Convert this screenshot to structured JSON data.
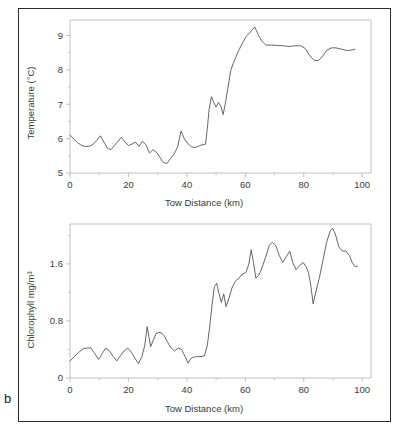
{
  "figure": {
    "panel_label": "b"
  },
  "chart_data": [
    {
      "type": "line",
      "id": "temperature",
      "title": "",
      "xlabel": "Tow Distance (km)",
      "ylabel": "Temperature (°C)",
      "xlim": [
        0,
        103
      ],
      "ylim": [
        5,
        9.45
      ],
      "grid": false,
      "legend": null,
      "xticks": [
        0,
        20,
        40,
        60,
        80,
        100
      ],
      "xtick_labels": [
        "0",
        "20",
        "40",
        "60",
        "80",
        "100"
      ],
      "xminor_ticks": [
        10,
        30,
        50,
        70,
        90
      ],
      "yticks": [
        5,
        6,
        7,
        8,
        9
      ],
      "ytick_labels": [
        "5",
        "6",
        "7",
        "8",
        "9"
      ],
      "yminor_ticks": [
        5.5,
        6.5,
        7.5,
        8.5
      ],
      "series": [
        {
          "name": "Temperature",
          "x": [
            0,
            1.2,
            2.6,
            4.0,
            5.4,
            6.8,
            8.0,
            9.2,
            10.4,
            11.6,
            12.8,
            14.0,
            15.2,
            16.4,
            17.6,
            18.8,
            20.0,
            21.2,
            22.4,
            23.6,
            24.8,
            26.0,
            27.2,
            28.4,
            29.6,
            30.8,
            32.0,
            33.2,
            34.4,
            35.6,
            36.8,
            38.0,
            39.2,
            40.4,
            41.6,
            42.8,
            44.0,
            45.2,
            46.4,
            47.0,
            47.6,
            48.4,
            49.2,
            50.0,
            50.8,
            51.6,
            52.4,
            53.2,
            54.0,
            55.0,
            56.0,
            57.5,
            59.0,
            60.5,
            62.0,
            63.2,
            64.5,
            65.8,
            67.0,
            69.0,
            71.0,
            73.0,
            75.0,
            77.0,
            79.0,
            80.5,
            82.0,
            83.5,
            85.0,
            86.5,
            88.0,
            89.5,
            91.0,
            93.0,
            95.0,
            96.5,
            97.5
          ],
          "y": [
            6.1,
            6.0,
            5.88,
            5.8,
            5.77,
            5.78,
            5.84,
            5.95,
            6.08,
            5.9,
            5.72,
            5.68,
            5.8,
            5.92,
            6.04,
            5.9,
            5.8,
            5.84,
            5.9,
            5.78,
            5.92,
            5.82,
            5.58,
            5.68,
            5.6,
            5.45,
            5.3,
            5.28,
            5.42,
            5.55,
            5.75,
            6.22,
            5.98,
            5.85,
            5.76,
            5.74,
            5.78,
            5.82,
            5.84,
            6.3,
            6.85,
            7.22,
            7.05,
            6.92,
            7.05,
            6.95,
            6.7,
            7.05,
            7.45,
            7.98,
            8.22,
            8.52,
            8.78,
            9.0,
            9.12,
            9.25,
            9.0,
            8.82,
            8.72,
            8.72,
            8.71,
            8.7,
            8.68,
            8.7,
            8.7,
            8.62,
            8.42,
            8.28,
            8.27,
            8.4,
            8.58,
            8.64,
            8.64,
            8.6,
            8.56,
            8.58,
            8.6
          ]
        }
      ]
    },
    {
      "type": "line",
      "id": "chlorophyll",
      "title": "",
      "xlabel": "Tow Distance (km)",
      "ylabel": "Chlorophyll mg/m³",
      "xlim": [
        0,
        103
      ],
      "ylim": [
        0,
        2.16
      ],
      "grid": false,
      "legend": null,
      "xticks": [
        0,
        20,
        40,
        60,
        80,
        100
      ],
      "xtick_labels": [
        "0",
        "20",
        "40",
        "60",
        "80",
        "100"
      ],
      "xminor_ticks": [
        10,
        30,
        50,
        70,
        90
      ],
      "yticks": [
        0,
        0.8,
        1.6
      ],
      "ytick_labels": [
        "0",
        "0.8",
        "1.6"
      ],
      "yminor_ticks": [
        0.4,
        1.2,
        2.0
      ],
      "series": [
        {
          "name": "Chlorophyll",
          "x": [
            0,
            1.5,
            3.0,
            4.5,
            6.0,
            7.2,
            8.5,
            9.8,
            11.0,
            12.2,
            13.5,
            14.8,
            16.0,
            17.2,
            18.5,
            19.8,
            21.0,
            22.2,
            23.4,
            24.6,
            25.6,
            26.4,
            27.0,
            27.6,
            28.4,
            29.4,
            30.4,
            31.4,
            32.4,
            33.4,
            34.6,
            35.8,
            37.0,
            38.2,
            39.4,
            40.4,
            41.5,
            43.0,
            44.5,
            46.0,
            47.0,
            47.8,
            48.6,
            49.4,
            50.2,
            51.0,
            51.8,
            52.6,
            53.4,
            54.4,
            55.4,
            56.6,
            57.8,
            59.0,
            60.2,
            61.2,
            62.0,
            62.8,
            63.6,
            64.6,
            65.8,
            67.0,
            68.2,
            69.2,
            70.4,
            71.6,
            72.8,
            74.0,
            75.2,
            76.2,
            77.4,
            78.6,
            79.8,
            80.8,
            81.6,
            82.4,
            83.2,
            84.2,
            85.4,
            86.6,
            87.8,
            89.0,
            89.8,
            90.8,
            92.0,
            93.2,
            94.4,
            95.6,
            96.6,
            97.6,
            98.4
          ],
          "y": [
            0.24,
            0.3,
            0.36,
            0.41,
            0.42,
            0.42,
            0.34,
            0.26,
            0.34,
            0.42,
            0.38,
            0.3,
            0.24,
            0.31,
            0.38,
            0.42,
            0.36,
            0.28,
            0.2,
            0.3,
            0.46,
            0.72,
            0.58,
            0.44,
            0.52,
            0.62,
            0.64,
            0.63,
            0.58,
            0.5,
            0.42,
            0.38,
            0.42,
            0.4,
            0.3,
            0.21,
            0.28,
            0.3,
            0.3,
            0.31,
            0.46,
            0.72,
            1.02,
            1.28,
            1.33,
            1.18,
            1.06,
            1.18,
            1.0,
            1.12,
            1.26,
            1.36,
            1.4,
            1.46,
            1.48,
            1.6,
            1.8,
            1.62,
            1.4,
            1.44,
            1.56,
            1.7,
            1.86,
            1.9,
            1.86,
            1.72,
            1.62,
            1.7,
            1.78,
            1.62,
            1.52,
            1.58,
            1.62,
            1.56,
            1.48,
            1.3,
            1.04,
            1.22,
            1.42,
            1.66,
            1.9,
            2.06,
            2.1,
            2.02,
            1.84,
            1.78,
            1.78,
            1.72,
            1.62,
            1.56,
            1.57
          ]
        }
      ]
    }
  ]
}
